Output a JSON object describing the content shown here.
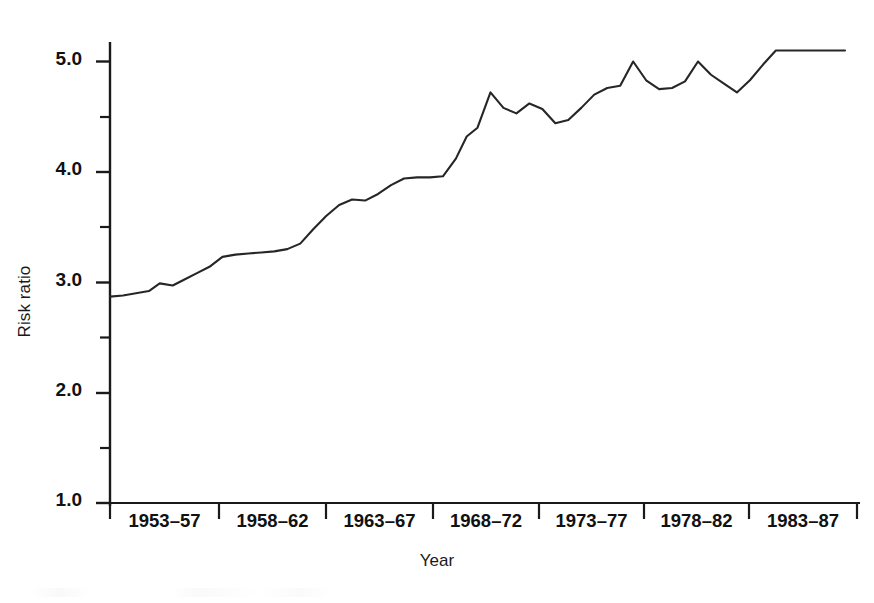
{
  "chart_data": {
    "type": "line",
    "title": "",
    "xlabel": "Year",
    "ylabel": "Risk ratio",
    "ylim": [
      1.0,
      5.3
    ],
    "yticks": [
      1.0,
      1.5,
      2.0,
      2.5,
      3.0,
      3.5,
      4.0,
      4.5,
      5.0
    ],
    "ytick_labels": [
      "1.0",
      "",
      "2.0",
      "",
      "3.0",
      "",
      "4.0",
      "",
      "5.0"
    ],
    "ytick_major": [
      "1.0",
      "2.0",
      "3.0",
      "4.0",
      "5.0"
    ],
    "categories": [
      "1953–57",
      "1958–62",
      "1963–67",
      "1968–72",
      "1973–77",
      "1978–82",
      "1983–87"
    ],
    "xtick_labels": [
      "1953–57",
      "1958–62",
      "1963–67",
      "1968–72",
      "1973–77",
      "1978–82",
      "1983–87"
    ],
    "grid": false,
    "legend": false,
    "line_color": "#262626",
    "line_width": 2.0,
    "x_domain": [
      1953,
      1987
    ],
    "series": [
      {
        "name": "Risk ratio",
        "x": [
          1953.0,
          1953.6,
          1954.2,
          1954.8,
          1955.3,
          1955.9,
          1956.4,
          1957.0,
          1957.6,
          1958.2,
          1958.8,
          1959.4,
          1960.0,
          1960.6,
          1961.2,
          1961.8,
          1962.4,
          1963.0,
          1963.6,
          1964.2,
          1964.8,
          1965.4,
          1966.0,
          1966.6,
          1967.2,
          1967.8,
          1968.4,
          1969.0,
          1969.5,
          1970.0,
          1970.6,
          1971.2,
          1971.8,
          1972.4,
          1973.0,
          1973.6,
          1974.2,
          1974.8,
          1975.4,
          1976.0,
          1976.6,
          1977.2,
          1977.8,
          1978.4,
          1979.0,
          1979.6,
          1980.2,
          1980.8,
          1981.4,
          1982.0,
          1982.6,
          1983.2,
          1983.8,
          1984.4,
          1985.0,
          1986.0,
          1987.0
        ],
        "values": [
          2.87,
          2.88,
          2.9,
          2.92,
          2.99,
          2.97,
          3.02,
          3.08,
          3.14,
          3.23,
          3.25,
          3.26,
          3.27,
          3.28,
          3.3,
          3.35,
          3.48,
          3.6,
          3.7,
          3.75,
          3.74,
          3.8,
          3.88,
          3.94,
          3.95,
          3.95,
          3.96,
          4.12,
          4.32,
          4.4,
          4.72,
          4.58,
          4.53,
          4.62,
          4.57,
          4.44,
          4.47,
          4.58,
          4.7,
          4.76,
          4.78,
          5.0,
          4.83,
          4.75,
          4.76,
          4.82,
          5.0,
          4.88,
          4.8,
          4.72,
          4.83,
          4.97,
          5.1,
          5.1,
          5.1,
          5.1,
          5.1
        ]
      }
    ],
    "annotations": []
  },
  "axes": {
    "y_axis_label": "Risk ratio",
    "x_axis_label": "Year",
    "y_tick_1": "1.0",
    "y_tick_2": "2.0",
    "y_tick_3": "3.0",
    "y_tick_4": "4.0",
    "y_tick_5": "5.0",
    "x_tick_1": "1953–57",
    "x_tick_2": "1958–62",
    "x_tick_3": "1963–67",
    "x_tick_4": "1968–72",
    "x_tick_5": "1973–77",
    "x_tick_6": "1978–82",
    "x_tick_7": "1983–87"
  },
  "style": {
    "axis_color": "#1a1a1a",
    "line_color": "#262626",
    "background": "#ffffff"
  }
}
